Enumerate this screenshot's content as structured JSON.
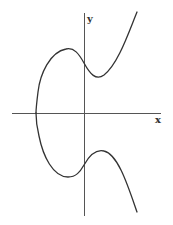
{
  "diagram": {
    "type": "elliptic-curve",
    "axes": {
      "x_label": "x",
      "y_label": "y"
    },
    "colors": {
      "background": "#ffffff",
      "axis": "#555555",
      "curve": "#333333"
    }
  }
}
